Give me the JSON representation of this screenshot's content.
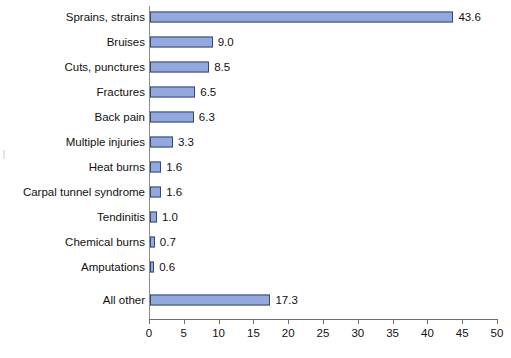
{
  "chart_data": {
    "type": "bar",
    "orientation": "horizontal",
    "title": "",
    "subtitle": "",
    "xlabel": "",
    "ylabel": "",
    "xlim": [
      0,
      50
    ],
    "xticks": [
      0,
      5,
      10,
      15,
      20,
      25,
      30,
      35,
      40,
      45,
      50
    ],
    "grid": false,
    "legend": false,
    "bar_color": "#93a9dd",
    "bar_border_color": "#36486f",
    "axis_color": "#6f6f6f",
    "categories": [
      "Sprains, strains",
      "Bruises",
      "Cuts, punctures",
      "Fractures",
      "Back pain",
      "Multiple injuries",
      "Heat burns",
      "Carpal tunnel syndrome",
      "Tendinitis",
      "Chemical burns",
      "Amputations",
      "All other"
    ],
    "values": [
      43.6,
      9.0,
      8.5,
      6.5,
      6.3,
      3.3,
      1.6,
      1.6,
      1.0,
      0.7,
      0.6,
      17.3
    ],
    "value_labels": [
      "43.6",
      "9.0",
      "8.5",
      "6.5",
      "6.3",
      "3.3",
      "1.6",
      "1.6",
      "1.0",
      "0.7",
      "0.6",
      "17.3"
    ],
    "xtick_labels": [
      "0",
      "5",
      "10",
      "15",
      "20",
      "25",
      "30",
      "35",
      "40",
      "45",
      "50"
    ]
  }
}
